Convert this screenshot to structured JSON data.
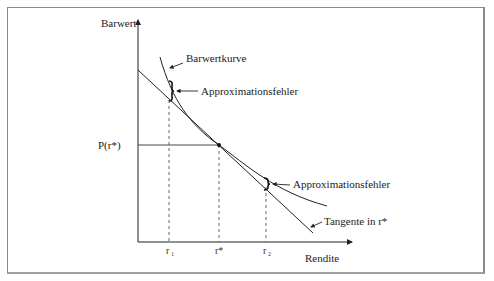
{
  "diagram": {
    "y_axis_label": "Barwert",
    "x_axis_label": "Rendite",
    "curve_label": "Barwertkurve",
    "tangent_label": "Tangente in r*",
    "error_label_top": "Approximationsfehler",
    "error_label_bottom": "Approximationsfehler",
    "y_tick_label": "P(r*)",
    "x_ticks": {
      "r1": "r",
      "r1_sub": "1",
      "rstar": "r*",
      "r2": "r",
      "r2_sub": "2"
    }
  },
  "colors": {
    "line": "#222222",
    "frame": "#8a8a8a",
    "dashed": "#555555"
  }
}
